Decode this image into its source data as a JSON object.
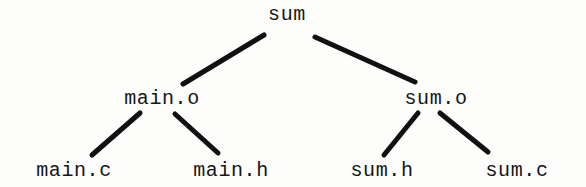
{
  "diagram": {
    "kind": "dependency-tree",
    "title": "",
    "background_color": "#fdfdfc",
    "text_color": "#161616",
    "edge_color": "#111111",
    "edge_width_px": 5,
    "nodes": [
      {
        "id": "sum",
        "label": "sum",
        "level": 0,
        "cx": 287,
        "cy": 15
      },
      {
        "id": "main_o",
        "label": "main.o",
        "level": 1,
        "cx": 162,
        "cy": 99
      },
      {
        "id": "sum_o",
        "label": "sum.o",
        "level": 1,
        "cx": 436,
        "cy": 99
      },
      {
        "id": "main_c",
        "label": "main.c",
        "level": 2,
        "cx": 74,
        "cy": 171
      },
      {
        "id": "main_h",
        "label": "main.h",
        "level": 2,
        "cx": 231,
        "cy": 171
      },
      {
        "id": "sum_h",
        "label": "sum.h",
        "level": 2,
        "cx": 382,
        "cy": 171
      },
      {
        "id": "sum_c",
        "label": "sum.c",
        "level": 2,
        "cx": 517,
        "cy": 171
      }
    ],
    "edges": [
      {
        "id": "sum-main_o",
        "from": "sum",
        "to": "main_o",
        "x1": 264,
        "y1": 35,
        "x2": 183,
        "y2": 84
      },
      {
        "id": "sum-sum_o",
        "from": "sum",
        "to": "sum_o",
        "x1": 315,
        "y1": 37,
        "x2": 415,
        "y2": 82
      },
      {
        "id": "main_o-main_c",
        "from": "main_o",
        "to": "main_c",
        "x1": 140,
        "y1": 113,
        "x2": 92,
        "y2": 155
      },
      {
        "id": "main_o-main_h",
        "from": "main_o",
        "to": "main_h",
        "x1": 175,
        "y1": 114,
        "x2": 218,
        "y2": 153
      },
      {
        "id": "sum_o-sum_h",
        "from": "sum_o",
        "to": "sum_h",
        "x1": 418,
        "y1": 113,
        "x2": 384,
        "y2": 155
      },
      {
        "id": "sum_o-sum_c",
        "from": "sum_o",
        "to": "sum_c",
        "x1": 440,
        "y1": 113,
        "x2": 488,
        "y2": 152
      }
    ]
  }
}
